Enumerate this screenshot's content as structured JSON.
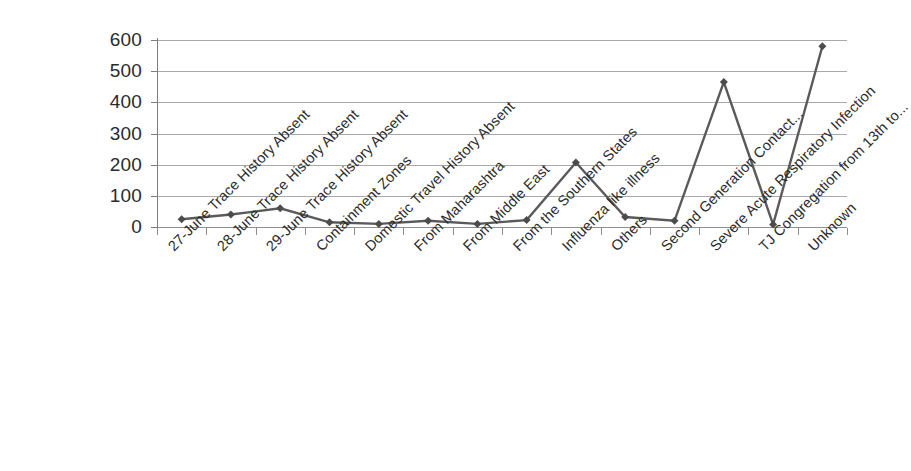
{
  "chart_data": {
    "type": "line",
    "title": "",
    "subtitle": "",
    "xlabel": "",
    "ylabel": "",
    "ylim": [
      0,
      600
    ],
    "y_ticks": [
      0,
      100,
      200,
      300,
      400,
      500,
      600
    ],
    "y_tick_labels": [
      "0",
      "100",
      "200",
      "300",
      "400",
      "500",
      "600"
    ],
    "grid": true,
    "legend": "none",
    "marker": "diamond",
    "line_color": "#5a5a5a",
    "marker_color": "#4c4c4c",
    "grid_color": "#9a9a9a",
    "axis_color": "#7d7d7d",
    "categories": [
      "27-June Trace History Absent",
      "28-June Trace History Absent",
      "29-June Trace History Absent",
      "Containment Zones",
      "Domestic Travel History Absent",
      "From Maharashtra",
      "From Middle East",
      "From the Southern States",
      "Influenza like illness",
      "Others",
      "Second Generation Contact...",
      "Severe Acute Respiratory Infection",
      "TJ Congregation from 13th to...",
      "Unknown"
    ],
    "values": [
      25,
      40,
      60,
      15,
      10,
      20,
      10,
      22,
      207,
      32,
      20,
      465,
      8,
      580
    ],
    "series": [
      {
        "name": "Count",
        "values": [
          25,
          40,
          60,
          15,
          10,
          20,
          10,
          22,
          207,
          32,
          20,
          465,
          8,
          580
        ]
      }
    ]
  }
}
